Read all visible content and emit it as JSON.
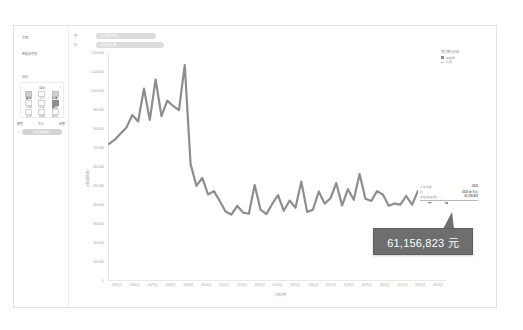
{
  "sidebar": {
    "section_title": "页面",
    "subsection_title": "数据源字段",
    "marks_title": "标记",
    "card": {
      "type_label": "自动",
      "caret_icon": "chevron-down-icon",
      "cells": [
        {
          "icon": "color-icon",
          "label": "颜色"
        },
        {
          "icon": "size-icon",
          "label": "大小"
        },
        {
          "icon": "label-icon",
          "label": "标签"
        },
        {
          "icon": "detail-icon",
          "label": "详细"
        },
        {
          "icon": "tooltip-icon",
          "label": "工具"
        },
        {
          "icon": "path-icon",
          "label": "路径"
        },
        {
          "icon": "shape-icon",
          "label": "形状"
        },
        {
          "icon": "angle-icon",
          "label": "角度"
        },
        {
          "icon": "more-icon",
          "label": "其他"
        }
      ]
    },
    "row_labels": [
      "颜色",
      "大小",
      "标签"
    ],
    "field_pill": {
      "icon": "abc-icon",
      "label": "总和(销售额)"
    }
  },
  "filters": [
    {
      "label": "列",
      "value": "年(订单日期)"
    },
    {
      "label": "行",
      "value": "总和(销售额)"
    }
  ],
  "legend": {
    "title": "销售额与利润",
    "items": [
      {
        "swatch": "square",
        "label": "销售额"
      },
      {
        "swatch": "line",
        "label": "利润"
      }
    ]
  },
  "tooltip": {
    "rows": [
      {
        "key": "订单日期",
        "value": "2023"
      },
      {
        "key": "月",
        "value": "2023 年 8 月"
      },
      {
        "key": "总和(销售额)",
        "value": "61,156,823"
      }
    ]
  },
  "callout": {
    "value": "61,156,823 元"
  },
  "chart_data": {
    "type": "line",
    "title": "",
    "xlabel": "订单日期",
    "ylabel": "总和(销售额)",
    "ylim": [
      0,
      1200000
    ],
    "grid": false,
    "legend_position": "top-right",
    "ytick_labels": [
      "1,200,000",
      "1,100,000",
      "1,000,000",
      "900,000",
      "800,000",
      "700,000",
      "600,000",
      "500,000",
      "400,000",
      "300,000",
      "200,000",
      "100,000",
      "0"
    ],
    "ytick_values": [
      1200000,
      1100000,
      1000000,
      900000,
      800000,
      700000,
      600000,
      500000,
      400000,
      300000,
      200000,
      100000,
      0
    ],
    "xtick_labels": [
      "2005Q1",
      "2006Q1",
      "2007Q1",
      "2008Q1",
      "2009Q1",
      "2010Q1",
      "2011Q1",
      "2012Q1",
      "2013Q1",
      "2014Q1",
      "2015Q1",
      "2016Q1",
      "2017Q1",
      "2018Q1",
      "2019Q1",
      "2020Q1",
      "2021Q1",
      "2022Q1",
      "2023Q1"
    ],
    "series": [
      {
        "name": "销售额",
        "values": [
          720000,
          742000,
          775000,
          806000,
          872000,
          838000,
          1012000,
          846000,
          1060000,
          866000,
          948000,
          920000,
          898000,
          1136000,
          612000,
          498000,
          540000,
          452000,
          470000,
          418000,
          362000,
          346000,
          392000,
          356000,
          350000,
          502000,
          372000,
          348000,
          402000,
          448000,
          366000,
          420000,
          382000,
          520000,
          360000,
          372000,
          468000,
          404000,
          432000,
          512000,
          394000,
          480000,
          424000,
          560000,
          430000,
          418000,
          470000,
          452000,
          392000,
          404000,
          398000,
          444000,
          398000,
          470000,
          436000,
          410000,
          428000,
          444000,
          406000
        ]
      }
    ]
  }
}
